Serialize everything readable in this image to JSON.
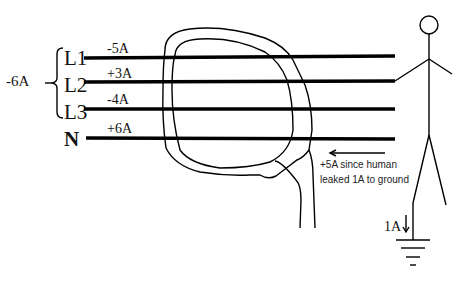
{
  "diagram": {
    "group_current": "-6A",
    "conductors": [
      {
        "label": "L1",
        "current": "-5A",
        "y": 58
      },
      {
        "label": "L2",
        "current": "+3A",
        "y": 82
      },
      {
        "label": "L3",
        "current": "-4A",
        "y": 109
      },
      {
        "label": "N",
        "current": "+6A",
        "y": 138
      }
    ],
    "annotation": {
      "line1": "+5A since human",
      "line2": "leaked 1A to ground"
    },
    "ground_current": "1A",
    "colors": {
      "line": "#000000",
      "background": "#ffffff"
    }
  }
}
